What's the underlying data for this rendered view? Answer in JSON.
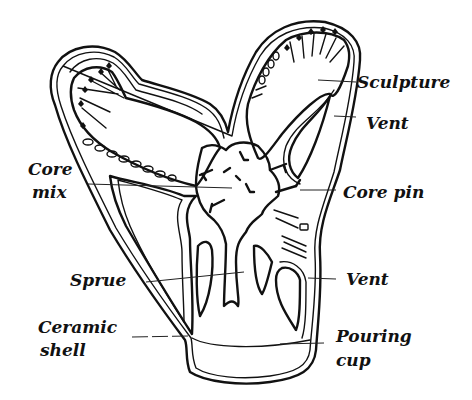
{
  "figure": {
    "labels": {
      "sculpture": "Sculpture",
      "vent_upper": "Vent",
      "core_mix_line1": "Core",
      "core_mix_line2": "mix",
      "core_pin": "Core pin",
      "sprue": "Sprue",
      "vent_lower": "Vent",
      "ceramic_shell_line1": "Ceramic",
      "ceramic_shell_line2": "shell",
      "pouring_cup_line1": "Pouring",
      "pouring_cup_line2": "cup"
    },
    "colors": {
      "line": "#111111",
      "background": "#ffffff"
    }
  }
}
